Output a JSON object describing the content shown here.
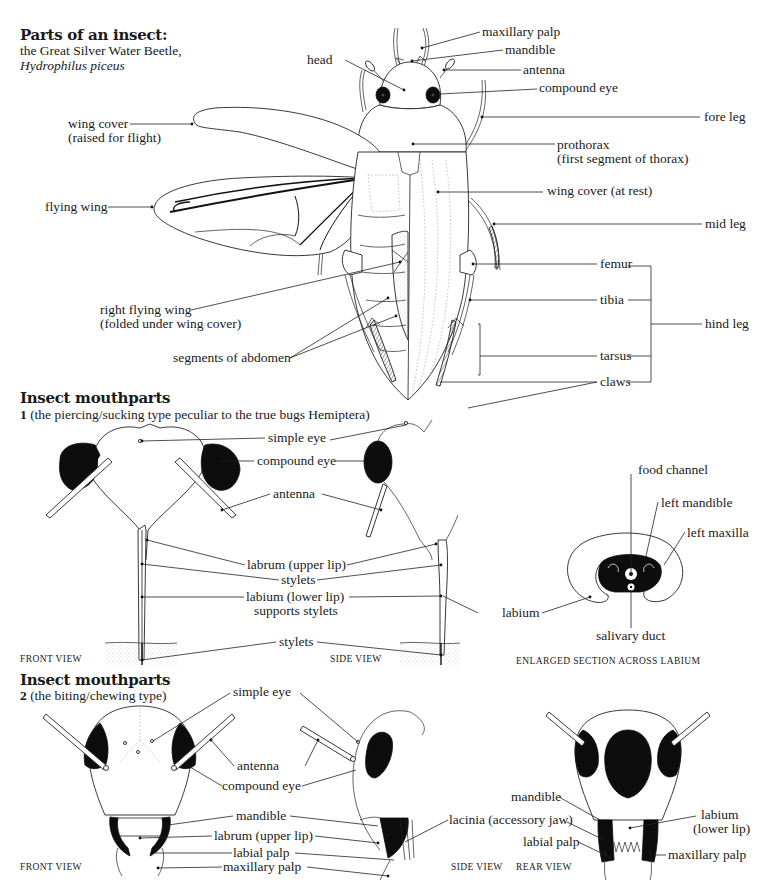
{
  "section1": {
    "title": "Parts of an insect:",
    "subtitle_line1": "the Great Silver Water Beetle,",
    "subtitle_line2": "Hydrophilus piceus",
    "labels": {
      "maxillary_palp": "maxillary palp",
      "mandible": "mandible",
      "head": "head",
      "antenna": "antenna",
      "compound_eye": "compound eye",
      "wing_cover_raised_1": "wing cover",
      "wing_cover_raised_2": "(raised for flight)",
      "fore_leg": "fore leg",
      "prothorax_1": "prothorax",
      "prothorax_2": "(first segment of thorax)",
      "flying_wing": "flying wing",
      "wing_cover_rest": "wing cover (at rest)",
      "mid_leg": "mid leg",
      "femur": "femur",
      "right_flying_wing_1": "right flying wing",
      "right_flying_wing_2": "(folded under wing cover)",
      "tibia": "tibia",
      "hind_leg": "hind leg",
      "segments_of_abdomen": "segments of abdomen",
      "tarsus": "tarsus",
      "claws": "claws"
    }
  },
  "section2": {
    "title": "Insect mouthparts",
    "number": "1",
    "subtitle": "(the piercing/sucking type peculiar to the true bugs Hemiptera)",
    "labels": {
      "simple_eye": "simple eye",
      "compound_eye": "compound eye",
      "antenna": "antenna",
      "labrum": "labrum (upper lip)",
      "stylets": "stylets",
      "labium_1": "labium (lower lip)",
      "labium_2": "supports stylets",
      "stylets_2": "stylets",
      "food_channel": "food channel",
      "left_mandible": "left mandible",
      "left_maxilla": "left maxilla",
      "labium": "labium",
      "salivary_duct": "salivary duct"
    },
    "captions": {
      "front": "FRONT VIEW",
      "side": "SIDE VIEW",
      "section": "ENLARGED SECTION ACROSS LABIUM"
    }
  },
  "section3": {
    "title": "Insect mouthparts",
    "number": "2",
    "subtitle": "(the biting/chewing type)",
    "labels": {
      "simple_eye": "simple eye",
      "antenna": "antenna",
      "compound_eye": "compound eye",
      "mandible": "mandible",
      "labrum": "labrum (upper lip)",
      "labial_palp": "labial palp",
      "maxillary_palp": "maxillary palp",
      "lacinia": "lacinia (accessory jaw)",
      "rear_mandible": "mandible",
      "rear_labial_palp": "labial palp",
      "rear_labium_1": "labium",
      "rear_labium_2": "(lower lip)",
      "rear_maxillary_palp": "maxillary palp"
    },
    "captions": {
      "front": "FRONT VIEW",
      "side": "SIDE VIEW",
      "rear": "REAR VIEW"
    }
  },
  "colors": {
    "ink": "#1a1a1a",
    "background": "#ffffff",
    "stipple": "#bbbbbb"
  }
}
